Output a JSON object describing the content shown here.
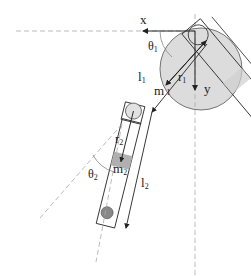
{
  "diagram": {
    "type": "double-pendulum schematic",
    "axes": {
      "x_label": "x",
      "y_label": "y"
    },
    "angles": {
      "theta1": "θ",
      "theta1_sub": "1",
      "theta2": "θ",
      "theta2_sub": "2"
    },
    "link1": {
      "length": "l",
      "length_sub": "1",
      "com_dist": "r",
      "com_dist_sub": "1",
      "mass": "m",
      "mass_sub": "1"
    },
    "link2": {
      "length": "l",
      "length_sub": "2",
      "com_dist": "r",
      "com_dist_sub": "2",
      "mass": "m",
      "mass_sub": "2"
    },
    "colors": {
      "line": "#222222",
      "dash": "#aaaaaa",
      "disc": "#dcdcdc",
      "mass_block": "#b0b0b0",
      "end_mass": "#888888"
    }
  }
}
